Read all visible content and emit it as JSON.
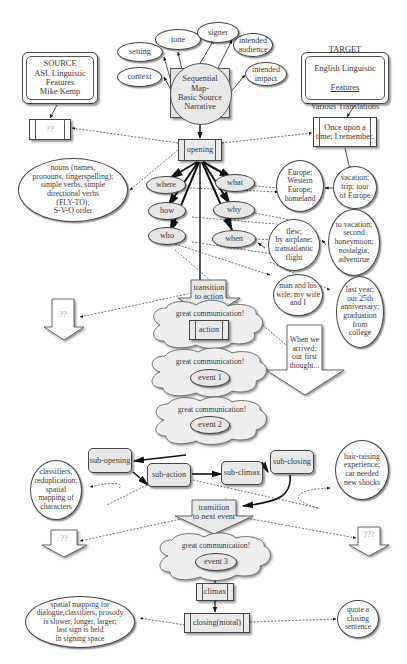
{
  "source_box": {
    "lines": "SOURCE\nASL Linguistic\nFeatures\nMike Kemp"
  },
  "target_box": {
    "title": "TARGET",
    "line2": "English Linguistic",
    "line3": "Features",
    "line4": "Various Translations"
  },
  "source_placeholder": {
    "text": "??"
  },
  "target_opening": {
    "text": "Once upon a\ntime; I remember,"
  },
  "central": {
    "text": "Sequential\nMap-\nBasic Source\nNarrative"
  },
  "context_nodes": [
    {
      "id": "setting",
      "label": "setting"
    },
    {
      "id": "context",
      "label": "context"
    },
    {
      "id": "tone",
      "label": "tone"
    },
    {
      "id": "signer",
      "label": "signer"
    },
    {
      "id": "intended-audience",
      "label": "intended\naudience"
    },
    {
      "id": "intended-impact",
      "label": "intended\nimpact"
    }
  ],
  "opening": {
    "label": "opening"
  },
  "wh_questions": [
    {
      "id": "where",
      "label": "where"
    },
    {
      "id": "how",
      "label": "how"
    },
    {
      "id": "who",
      "label": "who"
    },
    {
      "id": "what",
      "label": "what"
    },
    {
      "id": "why",
      "label": "why"
    },
    {
      "id": "when",
      "label": "when"
    }
  ],
  "asl_opening_features": {
    "text": "nouns (names,\npronouns, fingerspelling);\nsimple verbs, simple\ndirectional verbs\n(FLY-TO);\nS-V-O order"
  },
  "english_answers": {
    "where": "Europe;\nWestern\nEurope;\nhomeland",
    "what": "vacation;\ntrip; tour\nof Europe",
    "how": "flew;\nby airplane;\ntransatlantic\nflight",
    "why": "to vacation;\nsecond\nhoneymoon;\nnostalgia;\nadventrue",
    "who": "man and his\nwife; my wife\nand I",
    "when": "last year;\nour 25th\nanniversary;\ngraduation\nfrom\ncollege"
  },
  "transition_to_action": {
    "label": "transition\nto action"
  },
  "source_transition": {
    "text": "??"
  },
  "target_transition": {
    "text": "When we\narrived;\nour first\nthought..."
  },
  "clouds": {
    "label": "great communication!",
    "action": "action",
    "event1": "event 1",
    "event2": "event 2",
    "event3": "event 3"
  },
  "sub_events": [
    {
      "id": "sub-opening",
      "label": "sub-opening"
    },
    {
      "id": "sub-action",
      "label": "sub-action"
    },
    {
      "id": "sub-climax",
      "label": "sub-climax"
    },
    {
      "id": "sub-closing",
      "label": "sub-closing"
    }
  ],
  "asl_event_features": {
    "text": "classifiers,\nreduplication;\nspatial\nmapping of\ncharacters"
  },
  "english_event_features": {
    "text": "hair-raising\nexperience;\ncar needed\nnew shocks"
  },
  "transition_next_event": {
    "label": "transition\nto next event"
  },
  "source_next": {
    "text": "??"
  },
  "target_next": {
    "text": "???"
  },
  "climax": {
    "label": "climax"
  },
  "closing": {
    "label": "closing(moral)"
  },
  "asl_closing_features": {
    "text": "spatial mapping for\ndialogue,classifiers, prosody\nis slower, longer, larger;\nlast sign is held\nin signing space"
  },
  "english_closing_features": {
    "text": "quote a\nclosing\nsentence"
  },
  "colors": {
    "line": "#222222",
    "fill_gray": "#e6e6e6",
    "text": "#3a3a3a"
  }
}
